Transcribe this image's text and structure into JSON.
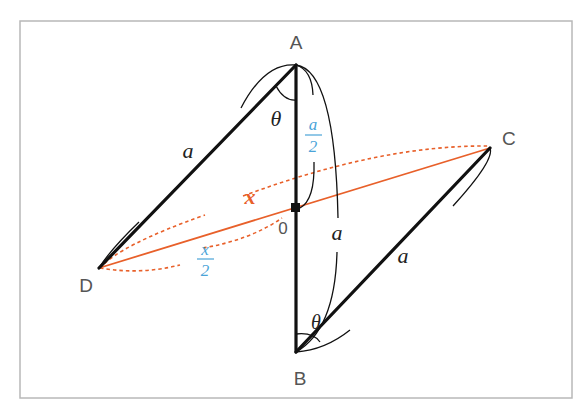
{
  "figure": {
    "type": "geometry-diagram",
    "points": {
      "A": {
        "label": "A"
      },
      "B": {
        "label": "B"
      },
      "C": {
        "label": "C"
      },
      "D": {
        "label": "D"
      },
      "O": {
        "label": "0"
      }
    },
    "labels": {
      "side_AD": "a",
      "side_AB": "a",
      "side_BC": "a",
      "angle_A": "θ",
      "angle_B": "θ",
      "diagonal_DC": "x",
      "half_AB_num": "a",
      "half_AB_den": "2",
      "half_DC_num": "x",
      "half_DC_den": "2"
    },
    "colors": {
      "frame": "#b8b8b8",
      "edge": "#111111",
      "diagonal": "#e8602a",
      "half_label": "#4aa3d8",
      "point_label": "#555555"
    }
  }
}
